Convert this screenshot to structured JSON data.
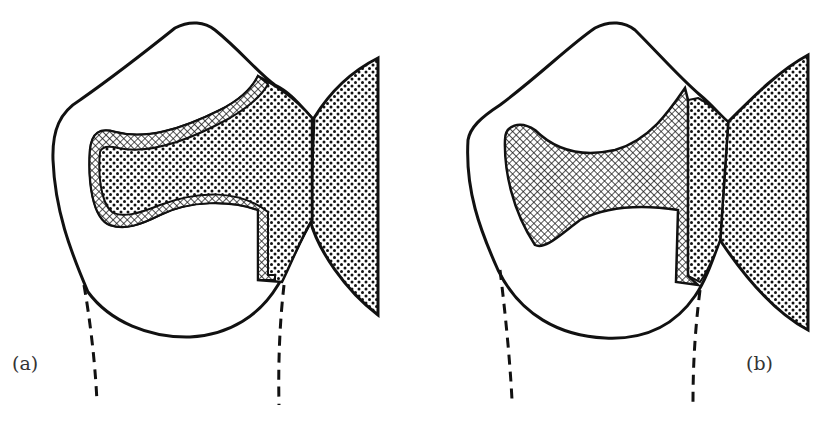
{
  "figure": {
    "panels": [
      {
        "id": "a",
        "label": "(a)",
        "description": "Tooth cross-section with inlay restoration outlined by crosshatched liner, dotted filling extending to adjacent tooth"
      },
      {
        "id": "b",
        "label": "(b)",
        "description": "Tooth cross-section with solid crosshatched restoration and dotted contact region against adjacent tooth"
      }
    ],
    "patterns": {
      "crosshatch": "crosshatch-pattern",
      "dotted": "dot-stipple-pattern"
    },
    "colors": {
      "ink": "#111111",
      "paper": "#ffffff"
    }
  }
}
